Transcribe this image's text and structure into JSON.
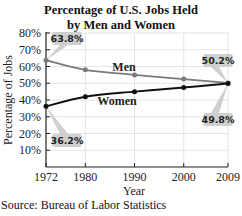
{
  "chart_data": {
    "type": "line",
    "title": "Percentage of U.S. Jobs Held by Men and Women",
    "title_lines": [
      "Percentage of U.S. Jobs Held",
      "by Men and Women"
    ],
    "xlabel": "Year",
    "ylabel": "Percentage of Jobs",
    "x": [
      1972,
      1980,
      1990,
      2000,
      2009
    ],
    "x_tick_labels": [
      "1972",
      "1980",
      "1990",
      "2000",
      "2009"
    ],
    "y_tick_labels": [
      "10%",
      "20%",
      "30%",
      "40%",
      "50%",
      "60%",
      "70%",
      "80%"
    ],
    "ylim": [
      0,
      80
    ],
    "grid": true,
    "series": [
      {
        "name": "Men",
        "values": [
          63.8,
          58.0,
          55.0,
          52.5,
          50.2
        ],
        "color": "#7a7a7a"
      },
      {
        "name": "Women",
        "values": [
          36.2,
          42.0,
          45.0,
          47.5,
          49.8
        ],
        "color": "#111111"
      }
    ],
    "annotations": [
      {
        "text": "63.8%",
        "series": "Men",
        "x": 1972
      },
      {
        "text": "36.2%",
        "series": "Women",
        "x": 1972
      },
      {
        "text": "50.2%",
        "series": "Men",
        "x": 2009
      },
      {
        "text": "49.8%",
        "series": "Women",
        "x": 2009
      }
    ],
    "source": "Source: Bureau of Labor Statistics"
  }
}
